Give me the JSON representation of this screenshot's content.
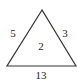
{
  "diagram": {
    "shape": "triangle",
    "left_side_label": "5",
    "right_side_label": "3",
    "center_label": "2",
    "bottom_label": "13",
    "stroke_color": "#333333"
  }
}
